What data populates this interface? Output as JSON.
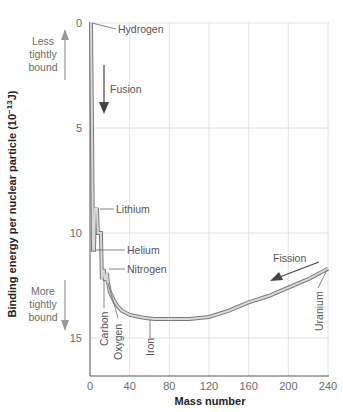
{
  "chart_data": {
    "type": "line",
    "title": "",
    "xlabel": "Mass number",
    "ylabel": "Binding energy per nuclear particle (10^-13 J)",
    "ylabel_parts": {
      "main": "Binding energy per nuclear particle (10",
      "sup": "−13",
      "tail": "J)"
    },
    "xlim": [
      0,
      240
    ],
    "ylim": [
      0,
      16.8
    ],
    "y_inverted": true,
    "grid": true,
    "x_ticks": [
      0,
      40,
      80,
      120,
      160,
      200,
      240
    ],
    "y_ticks": [
      0,
      5,
      10,
      15
    ],
    "series": [
      {
        "name": "Binding energy curve",
        "x": [
          1,
          2,
          3,
          4,
          5,
          6,
          7,
          8,
          9,
          10,
          11,
          12,
          13,
          14,
          15,
          16,
          17,
          18,
          20,
          24,
          28,
          32,
          40,
          50,
          56,
          65,
          80,
          100,
          120,
          140,
          160,
          180,
          200,
          220,
          240
        ],
        "y": [
          0,
          5.0,
          10.8,
          10.8,
          8.8,
          9.0,
          8.8,
          10.0,
          10.0,
          10.0,
          10.0,
          12.2,
          11.8,
          11.8,
          12.2,
          12.2,
          11.9,
          12.3,
          12.8,
          13.2,
          13.5,
          13.7,
          13.9,
          14.0,
          14.05,
          14.1,
          14.1,
          14.1,
          14.0,
          13.7,
          13.3,
          13.0,
          12.6,
          12.2,
          11.7
        ]
      }
    ],
    "annotations": [
      {
        "label": "Hydrogen",
        "x": 1,
        "y": 0
      },
      {
        "label": "Lithium",
        "x": 7,
        "y": 8.8
      },
      {
        "label": "Helium",
        "x": 4,
        "y": 10.8
      },
      {
        "label": "Nitrogen",
        "x": 14,
        "y": 11.8
      },
      {
        "label": "Carbon",
        "x": 12,
        "y": 12.2
      },
      {
        "label": "Oxygen",
        "x": 16,
        "y": 12.2
      },
      {
        "label": "Iron",
        "x": 56,
        "y": 14.05
      },
      {
        "label": "Uranium",
        "x": 238,
        "y": 11.7
      }
    ],
    "arrows": [
      {
        "label": "Fusion",
        "direction": "down"
      },
      {
        "label": "Fission",
        "direction": "toward lower mass"
      }
    ],
    "side_labels": {
      "top": [
        "Less",
        "tightly",
        "bound"
      ],
      "bottom": [
        "More",
        "tightly",
        "bound"
      ]
    }
  }
}
